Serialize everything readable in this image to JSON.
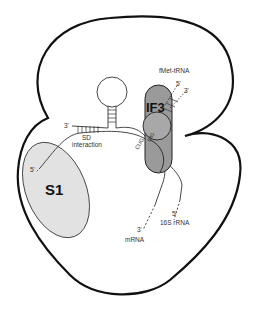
{
  "diagram": {
    "type": "ribosome-30S-initiation-complex",
    "colors": {
      "outline": "#111111",
      "s1_fill": "#e2e2e2",
      "if3_fill": "#9a9a9a",
      "background": "#ffffff"
    },
    "labels": {
      "fmet_trna": "fMet-tRNA",
      "trna_5prime": "5'",
      "trna_3prime": "3'",
      "if3": "IF3",
      "sd_3prime": "3'",
      "sd_line1": "SD",
      "sd_line2": "interaction",
      "s1_5prime": "5'",
      "s1": "S1",
      "mrna_3prime": "3'",
      "mrna": "mRNA",
      "rrna_5prime": "5'",
      "rrna": "16S rRNA",
      "codon": "CUG",
      "anticodon": "fMG"
    }
  }
}
